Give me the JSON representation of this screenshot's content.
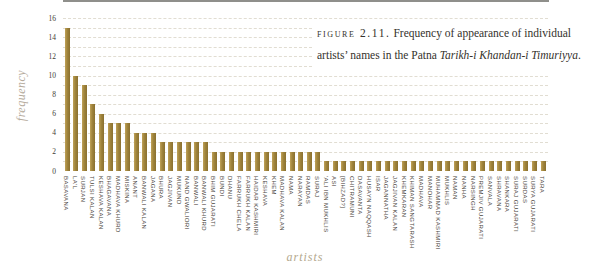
{
  "caption": {
    "figure_label": "figure 2.11.",
    "text_before": " Frequency of appearance of individual artists’ names in the Patna ",
    "book_title_italic": "Tarikh-i Khandan-i Timuriyya",
    "text_after": "."
  },
  "chart_data": {
    "type": "bar",
    "xlabel": "artists",
    "ylabel": "frequency",
    "ylim": [
      0,
      16
    ],
    "ytick_step": 2,
    "gridline_step": 1,
    "grid": "dashed horizontal minor gridlines",
    "legend": "none",
    "bar_color": "#a0843c",
    "categories": [
      "BASAVANA",
      "LA'L",
      "SURJAN",
      "TULSI KALAN",
      "KESHAVA KALAN",
      "BHAGAVANA",
      "MADHAVA KHURD",
      "MISKINA",
      "ANANT",
      "BANWALI KALAN",
      "JAGANA",
      "BHURA",
      "JAGJIVAN",
      "MUKUND",
      "NAND GWALIORI",
      "BANWALI",
      "BANWALI KHURD",
      "BHIM GUJARATI",
      "BUNDI",
      "DHANU",
      "FARRUKH CHELA",
      "FARRUKH KALAN",
      "HAIDAR KASHMIRI",
      "KESHAVA",
      "KHEM",
      "MADHAVA KALAN",
      "NAMA",
      "NARAYAN",
      "RAMDAS",
      "SURAJ",
      "'ALI IBN MUKHLIS",
      "ASI",
      "[BIHZAD?]",
      "CHITRAMUNI",
      "DASAVANTA",
      "HUSAYN NAQQASH",
      "ISAR",
      "JAGANNATHA",
      "JAGJIVAN KALAN",
      "KHEMKARAN",
      "KHIMAN SANGTARASH",
      "MADHAVA",
      "MANOHAR",
      "MUHAMMAD KASHMIRI",
      "MUKHLIS",
      "NAMAN",
      "NANHA",
      "NARSINGH",
      "PREMJIV GUJARATI",
      "SANVALA",
      "SHRAVANA",
      "SHANKARA",
      "SURAJ GUJARATI",
      "SURDAS",
      "SURYA GUJARATI",
      "TARA"
    ],
    "values": [
      15,
      10,
      9,
      7,
      6,
      5,
      5,
      5,
      4,
      4,
      4,
      3,
      3,
      3,
      3,
      3,
      3,
      2,
      2,
      2,
      2,
      2,
      2,
      2,
      2,
      2,
      2,
      2,
      2,
      2,
      1,
      1,
      1,
      1,
      1,
      1,
      1,
      1,
      1,
      1,
      1,
      1,
      1,
      1,
      1,
      1,
      1,
      1,
      1,
      1,
      1,
      1,
      1,
      1,
      1,
      1
    ],
    "yticks": [
      0,
      2,
      4,
      6,
      8,
      10,
      12,
      14,
      16
    ]
  },
  "layout": {
    "baseline_y": 171,
    "px_per_unit": 9.55,
    "plot_left": 63,
    "bar_slot": 8.655,
    "bar_width": 5
  }
}
